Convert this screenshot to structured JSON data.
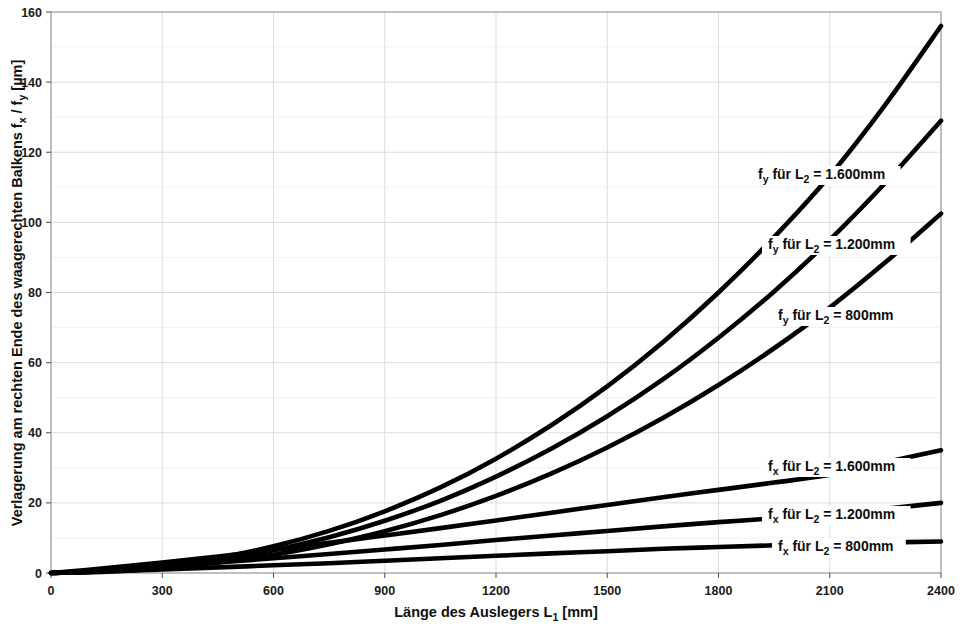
{
  "chart_data": {
    "type": "line",
    "title": "",
    "xlabel": "Länge des Auslegers L₁ [mm]",
    "ylabel": "Verlagerung am rechten Ende des waagerechten Balkens fₓ / fᵧ [µm]",
    "xlim": [
      0,
      2400
    ],
    "ylim": [
      0,
      160
    ],
    "xticks": [
      0,
      300,
      600,
      900,
      1200,
      1500,
      1800,
      2100,
      2400
    ],
    "xtick_labels": [
      "0",
      "300",
      "600",
      "900",
      "1200",
      "1500",
      "1800",
      "2100",
      "2400"
    ],
    "yticks": [
      0,
      20,
      40,
      60,
      80,
      100,
      120,
      140,
      160
    ],
    "ytick_labels": [
      "0",
      "20",
      "40",
      "60",
      "80",
      "100",
      "120",
      "140",
      "160"
    ],
    "grid": true,
    "legend_position": "inline-annotations",
    "line_color": "#000000",
    "grid_color": "#d8d8dc",
    "x": [
      0,
      150,
      300,
      450,
      600,
      750,
      900,
      1050,
      1200,
      1350,
      1500,
      1650,
      1800,
      1950,
      2100,
      2250,
      2400
    ],
    "series": [
      {
        "name": "fy_L2_1600",
        "label_main": "f",
        "label_sub": "y",
        "label_rest": " für L",
        "label_sub2": "2",
        "label_tail": " = 1.600mm",
        "label_text": "fᵧ für L₂ = 1.600mm",
        "values": [
          0,
          0.6,
          2.0,
          4.3,
          7.6,
          12.0,
          17.6,
          24.4,
          32.6,
          42.2,
          53.2,
          65.8,
          80.0,
          95.8,
          113.3,
          133.6,
          156.0
        ]
      },
      {
        "name": "fy_L2_1200",
        "label_main": "f",
        "label_sub": "y",
        "label_rest": " für L",
        "label_sub2": "2",
        "label_tail": " = 1.200mm",
        "label_text": "fᵧ für L₂ = 1.200mm",
        "values": [
          0,
          0.5,
          1.7,
          3.7,
          6.5,
          10.2,
          14.9,
          20.6,
          27.5,
          35.5,
          44.7,
          55.2,
          67.1,
          80.3,
          95.0,
          111.3,
          129.0
        ]
      },
      {
        "name": "fy_L2_800",
        "label_main": "f",
        "label_sub": "y",
        "label_rest": " für L",
        "label_sub2": "2",
        "label_tail": " = 800mm",
        "label_text": "fᵧ für L₂ = 800mm",
        "values": [
          0,
          0.4,
          1.4,
          3.0,
          5.2,
          8.2,
          11.9,
          16.5,
          22.0,
          28.4,
          35.8,
          44.2,
          53.6,
          64.1,
          75.7,
          88.6,
          102.5
        ]
      },
      {
        "name": "fx_L2_1600",
        "label_main": "f",
        "label_sub": "x",
        "label_rest": " für L",
        "label_sub2": "2",
        "label_tail": " = 1.600mm",
        "label_text": "fₓ für L₂ = 1.600mm",
        "values": [
          0,
          1.4,
          3.0,
          4.7,
          6.6,
          8.6,
          10.7,
          12.8,
          15.0,
          17.2,
          19.4,
          21.6,
          23.7,
          25.8,
          28.0,
          31.6,
          35.0
        ]
      },
      {
        "name": "fx_L2_1200",
        "label_main": "f",
        "label_sub": "x",
        "label_rest": " für L",
        "label_sub2": "2",
        "label_tail": " = 1.200mm",
        "label_text": "fₓ für L₂ = 1.200mm",
        "values": [
          0,
          0.9,
          1.9,
          3.0,
          4.2,
          5.4,
          6.7,
          8.0,
          9.4,
          10.7,
          12.0,
          13.3,
          14.5,
          15.6,
          16.6,
          18.3,
          20.0
        ]
      },
      {
        "name": "fx_L2_800",
        "label_main": "f",
        "label_sub": "x",
        "label_rest": " für L",
        "label_sub2": "2",
        "label_tail": " = 800mm",
        "label_text": "fₓ für L₂ = 800mm",
        "values": [
          0,
          0.5,
          1.0,
          1.6,
          2.2,
          2.8,
          3.5,
          4.2,
          4.9,
          5.6,
          6.2,
          6.9,
          7.4,
          7.9,
          8.3,
          8.7,
          9.0
        ]
      }
    ],
    "annotations": [
      {
        "text": "fᵧ für L₂ = 1.600mm",
        "x_px": 758,
        "y_px": 179
      },
      {
        "text": "fᵧ für L₂ = 1.200mm",
        "x_px": 768,
        "y_px": 249
      },
      {
        "text": "fᵧ für L₂ = 800mm",
        "x_px": 778,
        "y_px": 320
      },
      {
        "text": "fₓ für L₂ = 1.600mm",
        "x_px": 768,
        "y_px": 471
      },
      {
        "text": "fₓ für L₂ = 1.200mm",
        "x_px": 768,
        "y_px": 519
      },
      {
        "text": "fₓ für L₂ = 800mm",
        "x_px": 778,
        "y_px": 551
      }
    ]
  },
  "axis": {
    "y_label_parts": {
      "part1": "Verlagerung am rechten Ende des waagerechten Balkens f",
      "sub1": "x",
      "part2": " / f",
      "sub2": "y",
      "part3": " [µm]"
    },
    "x_label_parts": {
      "part1": "Länge des Auslegers L",
      "sub1": "1",
      "part2": " [mm]"
    }
  }
}
